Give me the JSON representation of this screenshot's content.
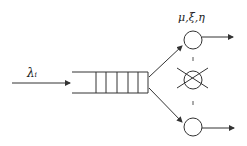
{
  "diagram": {
    "type": "queueing-system",
    "arrival_label": "λᵢ",
    "server_params_label": "μ,ξ,η",
    "queue_slots": 5,
    "servers": [
      {
        "name": "server-top",
        "state": "active"
      },
      {
        "name": "server-middle",
        "state": "failed"
      },
      {
        "name": "server-bottom",
        "state": "active"
      }
    ],
    "ellipsis": "⋮",
    "colors": {
      "stroke": "#333333",
      "background": "#ffffff"
    }
  }
}
